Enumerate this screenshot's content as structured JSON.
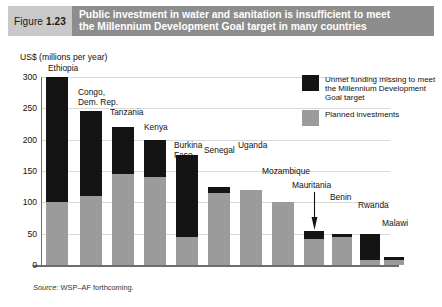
{
  "figure": {
    "tag_label": "Figure",
    "tag_number": "1.23",
    "title_line1": "Public investment in water and sanitation is insufficient to meet",
    "title_line2": "the Millennium Development Goal target in many countries",
    "source_prefix": "Source:",
    "source_text": "WSP–AF forthcoming."
  },
  "legend": {
    "position": "top-right",
    "items": [
      {
        "swatch": "unmet",
        "color": "#141414",
        "label": "Unmet funding missing to meet the Millennium Development Goal target"
      },
      {
        "swatch": "planned",
        "color": "#9b9b9b",
        "label": "Planned investments"
      }
    ]
  },
  "chart_data": {
    "type": "bar",
    "stacked": true,
    "title": "Public investment in water and sanitation is insufficient to meet the Millennium Development Goal target in many countries",
    "xlabel": "",
    "ylabel": "US$ (millions per year)",
    "ylim": [
      0,
      300
    ],
    "yticks": [
      0,
      50,
      100,
      150,
      200,
      250,
      300
    ],
    "ytick_labels": [
      "0",
      "50",
      "100",
      "150",
      "200",
      "250",
      "300"
    ],
    "grid": true,
    "legend_position": "top-right",
    "categories": [
      "Ethiopia",
      "Congo, Dem. Rep.",
      "Tanzania",
      "Kenya",
      "Burkina Faso",
      "Senegal",
      "Uganda",
      "Mozambique",
      "Mauritania",
      "Benin",
      "Rwanda",
      "Malawi"
    ],
    "category_labels": [
      [
        "Ethiopia"
      ],
      [
        "Congo,",
        "Dem. Rep."
      ],
      [
        "Tanzania"
      ],
      [
        "Kenya"
      ],
      [
        "Burkina",
        "Faso"
      ],
      [
        "Senegal"
      ],
      [
        "Uganda"
      ],
      [
        "Mozambique"
      ],
      [
        "Mauritania"
      ],
      [
        "Benin"
      ],
      [
        "Rwanda"
      ],
      [
        "Malawi"
      ]
    ],
    "series": [
      {
        "name": "Planned investments",
        "color": "#9b9b9b",
        "values": [
          100,
          110,
          145,
          140,
          45,
          115,
          120,
          100,
          42,
          45,
          8,
          8
        ]
      },
      {
        "name": "Unmet funding missing to meet the Millennium Development Goal target",
        "color": "#141414",
        "values": [
          200,
          135,
          75,
          60,
          130,
          10,
          0,
          0,
          13,
          5,
          42,
          4
        ]
      }
    ],
    "totals": [
      300,
      245,
      220,
      200,
      175,
      125,
      120,
      100,
      55,
      50,
      50,
      12
    ],
    "annotations": [
      {
        "type": "arrow",
        "target": "Mauritania",
        "note": "label leader arrow pointing down to bar"
      }
    ]
  }
}
